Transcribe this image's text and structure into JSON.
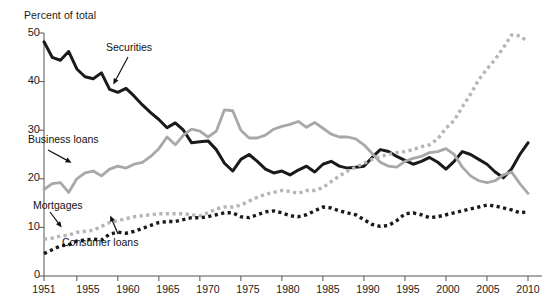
{
  "chart_data": {
    "type": "line",
    "title": "",
    "subtitle": "",
    "ylabel": "Percent of total",
    "xlabel": "",
    "ylim": [
      0,
      50
    ],
    "xlim": [
      1951,
      2010
    ],
    "grid": false,
    "legend_position": "inline-annotations",
    "ytick_labels": [
      "0",
      "10",
      "20",
      "30",
      "40",
      "50"
    ],
    "ytick_values": [
      0,
      10,
      20,
      30,
      40,
      50
    ],
    "xtick_labels": [
      "1951",
      "1955",
      "1960",
      "1965",
      "1970",
      "1975",
      "1980",
      "1985",
      "1990",
      "1995",
      "2000",
      "2005",
      "2010"
    ],
    "xtick_values": [
      1951,
      1955,
      1960,
      1965,
      1970,
      1975,
      1980,
      1985,
      1990,
      1995,
      2000,
      2005,
      2010
    ],
    "x": [
      1951,
      1952,
      1953,
      1954,
      1955,
      1956,
      1957,
      1958,
      1959,
      1960,
      1961,
      1962,
      1963,
      1964,
      1965,
      1966,
      1967,
      1968,
      1969,
      1970,
      1971,
      1972,
      1973,
      1974,
      1975,
      1976,
      1977,
      1978,
      1979,
      1980,
      1981,
      1982,
      1983,
      1984,
      1985,
      1986,
      1987,
      1988,
      1989,
      1990,
      1991,
      1992,
      1993,
      1994,
      1995,
      1996,
      1997,
      1998,
      1999,
      2000,
      2001,
      2002,
      2003,
      2004,
      2005,
      2006,
      2007,
      2008,
      2009,
      2010
    ],
    "series": [
      {
        "name": "Securities",
        "color": "#1a1a1a",
        "style": "solid",
        "label_text": "Securities",
        "values": [
          48.2,
          45.0,
          44.4,
          46.2,
          42.6,
          41.0,
          40.6,
          41.8,
          38.4,
          37.8,
          38.6,
          37.0,
          35.2,
          33.6,
          32.2,
          30.5,
          31.5,
          30.0,
          27.4,
          27.6,
          27.8,
          26.0,
          23.2,
          21.6,
          24.0,
          25.0,
          23.6,
          22.0,
          21.2,
          21.6,
          20.8,
          21.8,
          22.6,
          21.4,
          23.0,
          23.6,
          22.6,
          22.2,
          22.4,
          22.6,
          24.4,
          26.0,
          25.6,
          24.6,
          23.8,
          23.0,
          23.6,
          24.4,
          23.4,
          22.0,
          23.6,
          25.6,
          25.0,
          24.0,
          23.0,
          21.4,
          20.2,
          22.0,
          25.0,
          27.4
        ]
      },
      {
        "name": "Business loans",
        "color": "#a8a8a8",
        "style": "solid",
        "label_text": "Business loans",
        "values": [
          17.8,
          19.0,
          19.2,
          17.2,
          20.0,
          21.2,
          21.6,
          20.6,
          22.0,
          22.6,
          22.2,
          23.0,
          23.4,
          24.6,
          26.2,
          28.6,
          27.0,
          29.0,
          30.2,
          29.8,
          28.6,
          29.8,
          34.2,
          34.0,
          30.0,
          28.4,
          28.4,
          29.0,
          30.2,
          30.8,
          31.2,
          31.8,
          30.6,
          31.6,
          30.4,
          29.2,
          28.6,
          28.6,
          28.2,
          27.0,
          25.2,
          23.4,
          22.6,
          22.4,
          23.6,
          24.2,
          24.6,
          25.4,
          25.6,
          26.2,
          25.0,
          22.4,
          20.6,
          19.6,
          19.2,
          19.6,
          20.8,
          21.4,
          19.0,
          17.0
        ]
      },
      {
        "name": "Mortgages",
        "color": "#b5b5b5",
        "style": "dotted",
        "label_text": "Mortgages",
        "values": [
          7.6,
          7.8,
          8.2,
          8.4,
          9.0,
          9.2,
          9.4,
          10.2,
          11.0,
          11.4,
          11.8,
          12.2,
          12.4,
          12.6,
          12.8,
          12.8,
          12.8,
          12.8,
          12.6,
          12.4,
          13.0,
          13.8,
          14.2,
          14.2,
          14.6,
          15.4,
          16.2,
          16.8,
          17.2,
          17.6,
          17.4,
          17.0,
          17.6,
          17.6,
          18.2,
          19.4,
          20.6,
          21.6,
          22.4,
          23.2,
          24.0,
          24.6,
          25.0,
          25.4,
          25.6,
          26.0,
          26.6,
          27.0,
          28.2,
          30.4,
          32.0,
          34.8,
          37.4,
          40.4,
          42.6,
          44.6,
          47.0,
          49.6,
          49.4,
          48.2
        ]
      },
      {
        "name": "Consumer loans",
        "color": "#1a1a1a",
        "style": "dotted",
        "label_text": "Consumer loans",
        "values": [
          4.6,
          5.4,
          6.2,
          6.4,
          7.2,
          7.4,
          7.6,
          7.4,
          8.6,
          9.0,
          8.8,
          9.2,
          9.8,
          10.4,
          11.0,
          11.2,
          11.2,
          11.6,
          12.0,
          12.0,
          12.2,
          12.6,
          13.0,
          13.0,
          12.2,
          12.0,
          12.6,
          13.2,
          13.4,
          13.0,
          12.4,
          12.2,
          12.6,
          13.4,
          14.2,
          14.0,
          13.4,
          13.0,
          12.6,
          11.6,
          10.6,
          10.2,
          10.4,
          11.4,
          12.8,
          13.0,
          12.6,
          12.0,
          12.2,
          12.6,
          13.0,
          13.4,
          13.8,
          14.2,
          14.6,
          14.4,
          14.0,
          13.6,
          13.0,
          13.2
        ]
      }
    ],
    "annotations": [
      {
        "text": "Securities",
        "x_px": 106,
        "y_px": 48
      },
      {
        "text": "Business loans",
        "x_px": 28,
        "y_px": 140
      },
      {
        "text": "Mortgages",
        "x_px": 33,
        "y_px": 206
      },
      {
        "text": "Consumer loans",
        "x_px": 62,
        "y_px": 243
      }
    ]
  }
}
